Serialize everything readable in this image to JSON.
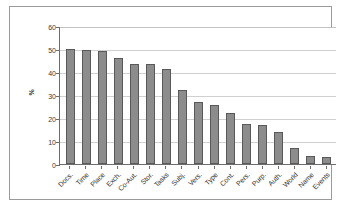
{
  "chart_data": {
    "type": "bar",
    "title": "",
    "xlabel": "",
    "ylabel": "%",
    "ylim": [
      0,
      60
    ],
    "yticks": [
      0,
      10,
      20,
      30,
      40,
      50,
      60
    ],
    "grid": true,
    "legend": false,
    "orientation": "vertical",
    "label_rotation": -45,
    "series_name": "",
    "bar_color": "#8c8c8c",
    "bar_edge_color": "#595959",
    "gridline_color": "#d0d0d0",
    "axis_color": "#6d6d6d",
    "frame_color": "#9a9a9a",
    "background": "#ffffff",
    "categories": [
      "Docs.",
      "Time",
      "Place",
      "Exch.",
      "Co-Aut.",
      "Stor.",
      "Tasks",
      "Subj.",
      "Vers.",
      "Type",
      "Cont.",
      "Pers.",
      "Purp.",
      "Auth.",
      "World",
      "Name",
      "Events"
    ],
    "values": [
      50,
      49.5,
      49,
      46,
      43.5,
      43.5,
      41.5,
      32,
      27,
      25.8,
      22,
      17.3,
      17,
      14,
      7,
      3.5,
      3
    ]
  }
}
